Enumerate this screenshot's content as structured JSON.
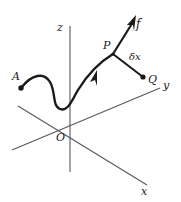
{
  "figure": {
    "type": "vector-field-diagram",
    "background_color": "#ffffff",
    "axis_color": "#58585a",
    "curve_color": "#1a1a1a",
    "label_color": "#1a1a1a"
  },
  "axes": {
    "z": {
      "label": "z"
    },
    "y": {
      "label": "y"
    },
    "x": {
      "label": "x"
    },
    "origin": {
      "label": "O"
    }
  },
  "points": {
    "a": {
      "label": "A"
    },
    "p": {
      "label": "P"
    },
    "q": {
      "label": "Q"
    }
  },
  "vectors": {
    "f": {
      "label": "f"
    },
    "dx": {
      "label": "δx"
    }
  }
}
